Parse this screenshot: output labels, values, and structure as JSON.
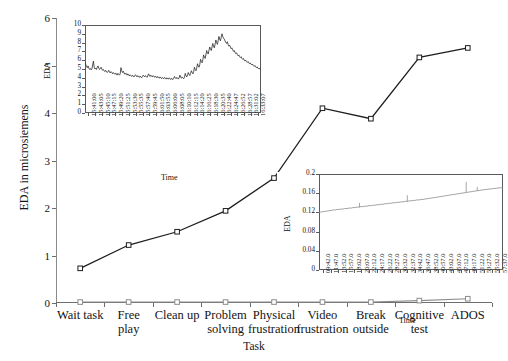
{
  "chart_data": {
    "type": "line",
    "title": "",
    "xlabel": "Task",
    "ylabel": "EDA in microsiemens",
    "ylim": [
      0,
      6
    ],
    "yticks": [
      0,
      1,
      2,
      3,
      4,
      5,
      6
    ],
    "grid": false,
    "legend": "none",
    "categories": [
      "Wait task",
      "Free play",
      "Clean up",
      "Problem solving",
      "Physical frustration",
      "Video frustration",
      "Break outside",
      "Cognitive test",
      "ADOS"
    ],
    "category_lines": [
      [
        "Wait task"
      ],
      [
        "Free",
        "play"
      ],
      [
        "Clean up"
      ],
      [
        "Problem",
        "solving"
      ],
      [
        "Physical",
        "frustration"
      ],
      [
        "Video",
        "frustration"
      ],
      [
        "Break",
        "outside"
      ],
      [
        "Cognitive",
        "test"
      ],
      [
        "ADOS"
      ]
    ],
    "series": [
      {
        "name": "EDA level",
        "color": "#1d1d1d",
        "marker": "open-square",
        "values": [
          0.73,
          1.22,
          1.5,
          1.94,
          2.63,
          4.1,
          3.88,
          5.17,
          5.37
        ]
      },
      {
        "name": "EDA baseline",
        "color": "#8c8c8c",
        "marker": "open-square",
        "values": [
          0.02,
          0.02,
          0.02,
          0.02,
          0.02,
          0.02,
          0.02,
          0.05,
          0.09
        ]
      }
    ]
  },
  "inset1": {
    "ylabel": "EDA",
    "xlabel": "Time",
    "ylim": [
      0,
      10
    ],
    "yticks": [
      "0",
      "1",
      "2",
      "3",
      "4",
      "5",
      "6",
      "7",
      "8",
      "9",
      "10"
    ],
    "xticks": [
      "15:41:00",
      "15:43:05",
      "15:45:10",
      "15:47:15",
      "15:49:20",
      "15:51:25",
      "15:53:30",
      "15:55:35",
      "15:57:40",
      "15:59:45",
      "16:01:50",
      "16:03:55",
      "16:06:00",
      "16:08:05",
      "16:10:10",
      "16:12:15",
      "16:14:20",
      "16:16:25",
      "16:18:30",
      "16:20:35",
      "16:22:40",
      "16:24:47",
      "16:26:52",
      "16:28:57",
      "16:31:02",
      "16:33:07"
    ],
    "trace": [
      5.75,
      5.5,
      5.3,
      5.15,
      5.35,
      5.1,
      4.95,
      5.05,
      4.9,
      5.0,
      5.45,
      5.9,
      5.2,
      5.0,
      5.1,
      4.95,
      5.2,
      5.35,
      5.1,
      4.95,
      5.05,
      5.2,
      5.0,
      4.85,
      4.95,
      4.8,
      4.7,
      4.85,
      4.75,
      4.6,
      4.7,
      4.85,
      4.65,
      4.55,
      4.7,
      4.6,
      4.45,
      4.6,
      4.5,
      4.4,
      4.55,
      4.45,
      4.3,
      4.5,
      4.4,
      4.3,
      4.45,
      5.15,
      4.8,
      4.6,
      4.75,
      4.55,
      4.4,
      4.55,
      4.45,
      4.3,
      4.45,
      4.35,
      4.2,
      4.35,
      4.25,
      4.15,
      4.3,
      4.2,
      4.1,
      4.25,
      4.35,
      4.2,
      4.1,
      4.25,
      4.15,
      4.05,
      4.2,
      4.1,
      4.0,
      4.15,
      4.3,
      4.2,
      4.1,
      4.25,
      4.15,
      4.05,
      4.2,
      4.45,
      4.3,
      4.15,
      4.3,
      4.2,
      4.1,
      4.25,
      4.15,
      4.05,
      4.2,
      4.1,
      4.0,
      4.15,
      4.05,
      3.95,
      4.1,
      4.0,
      3.9,
      4.05,
      3.95,
      3.9,
      4.05,
      3.95,
      3.85,
      4.0,
      3.9,
      3.85,
      4.0,
      3.9,
      3.8,
      3.95,
      3.85,
      3.8,
      3.95,
      4.15,
      4.0,
      3.9,
      4.05,
      3.95,
      3.85,
      4.0,
      4.3,
      4.1,
      3.95,
      4.1,
      4.0,
      3.9,
      4.05,
      4.5,
      4.25,
      4.1,
      4.3,
      4.6,
      4.4,
      4.25,
      4.5,
      4.8,
      4.6,
      4.45,
      4.7,
      5.2,
      4.95,
      4.8,
      5.1,
      5.6,
      5.35,
      5.2,
      5.5,
      6.1,
      5.85,
      5.7,
      6.05,
      6.6,
      6.35,
      6.2,
      6.6,
      7.1,
      6.85,
      6.7,
      7.1,
      7.5,
      7.25,
      7.1,
      7.5,
      7.9,
      7.6,
      7.4,
      7.8,
      8.3,
      8.0,
      7.8,
      8.2,
      8.7,
      8.4,
      8.2,
      8.6,
      9.0,
      8.7,
      8.5,
      8.4,
      8.2,
      8.0,
      7.9,
      8.1,
      7.8,
      7.6,
      7.7,
      7.5,
      7.3,
      7.4,
      7.2,
      7.0,
      7.1,
      6.9,
      6.75,
      6.85,
      6.65,
      6.5,
      6.6,
      6.4,
      6.3,
      6.4,
      6.2,
      6.1,
      6.2,
      6.0,
      5.9,
      6.0,
      5.85,
      5.75,
      5.85,
      5.7,
      5.6,
      5.7,
      5.55,
      5.45,
      5.55,
      5.4,
      5.3,
      5.4,
      5.25,
      5.15,
      5.25,
      5.1,
      5.0,
      5.1,
      4.95,
      4.9
    ]
  },
  "inset2": {
    "ylabel": "EDA",
    "xlabel": "Time",
    "ylim": [
      0,
      0.2
    ],
    "yticks": [
      "0",
      "0.04",
      "0.08",
      "0.12",
      "0.16",
      "0.2"
    ],
    "xticks": [
      "09:42.0",
      "11:47.0",
      "13:52.0",
      "15:57.0",
      "18:02.0",
      "20:07.0",
      "22:12.0",
      "24:17.0",
      "26:22.0",
      "28:27.0",
      "30:32.0",
      "32:37.0",
      "34:42.0",
      "36:47.0",
      "38:52.0",
      "40:57.0",
      "43:02.0",
      "45:07.0",
      "47:12.0",
      "49:17.0",
      "51:22.0",
      "53:27.0",
      "55:32.0",
      "57:37.0"
    ],
    "trace": [
      0.12,
      0.1205,
      0.121,
      0.1208,
      0.1215,
      0.122,
      0.1218,
      0.1225,
      0.123,
      0.1228,
      0.1235,
      0.124,
      0.1238,
      0.1245,
      0.125,
      0.1252,
      0.1248,
      0.1255,
      0.126,
      0.1262,
      0.1258,
      0.1265,
      0.127,
      0.1272,
      0.1268,
      0.1275,
      0.128,
      0.1282,
      0.1278,
      0.1285,
      0.129,
      0.1292,
      0.1288,
      0.1295,
      0.13,
      0.1302,
      0.1298,
      0.1305,
      0.131,
      0.1312,
      0.1308,
      0.1315,
      0.132,
      0.1322,
      0.1318,
      0.1325,
      0.133,
      0.1332,
      0.1328,
      0.1335,
      0.134,
      0.1342,
      0.1338,
      0.1345,
      0.135,
      0.1352,
      0.1348,
      0.1355,
      0.136,
      0.1362,
      0.1358,
      0.1365,
      0.137,
      0.1372,
      0.1368,
      0.1375,
      0.138,
      0.1382,
      0.1378,
      0.1385,
      0.139,
      0.1392,
      0.1388,
      0.1395,
      0.14,
      0.1402,
      0.1398,
      0.1405,
      0.141,
      0.1412,
      0.1408,
      0.1415,
      0.142,
      0.1422,
      0.1418,
      0.1425,
      0.143,
      0.1432,
      0.1428,
      0.1435,
      0.144,
      0.1442,
      0.1438,
      0.1445,
      0.145,
      0.1452,
      0.1448,
      0.1455,
      0.146,
      0.1462,
      0.1458,
      0.1465,
      0.147,
      0.1472,
      0.1468,
      0.1475,
      0.148,
      0.1478,
      0.1485,
      0.149,
      0.1488,
      0.1495,
      0.15,
      0.1498,
      0.1505,
      0.151,
      0.1508,
      0.1515,
      0.152,
      0.1518,
      0.1525,
      0.153,
      0.1528,
      0.1535,
      0.154,
      0.1538,
      0.1545,
      0.155,
      0.1548,
      0.1555,
      0.156,
      0.1558,
      0.1565,
      0.157,
      0.1568,
      0.1575,
      0.158,
      0.1578,
      0.1585,
      0.159,
      0.1588,
      0.1595,
      0.16,
      0.1598,
      0.1605,
      0.161,
      0.1608,
      0.1615,
      0.162,
      0.1618,
      0.1625,
      0.163,
      0.1628,
      0.1635,
      0.164,
      0.1638,
      0.1645,
      0.165,
      0.1648,
      0.1655,
      0.166,
      0.1658,
      0.1665,
      0.167,
      0.1668,
      0.1672,
      0.1675,
      0.1678,
      0.168,
      0.1682,
      0.1685,
      0.1688,
      0.169,
      0.1692,
      0.1695,
      0.1698,
      0.17,
      0.1702,
      0.1705,
      0.1708,
      0.171,
      0.1712,
      0.1715,
      0.1718,
      0.172
    ],
    "spikes": [
      {
        "pos": 0.22,
        "height": 0.009
      },
      {
        "pos": 0.48,
        "height": 0.013
      },
      {
        "pos": 0.8,
        "height": 0.022
      },
      {
        "pos": 0.86,
        "height": 0.008
      }
    ]
  }
}
